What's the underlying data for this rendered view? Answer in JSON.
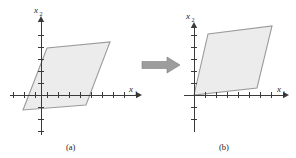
{
  "figure": {
    "type": "geometry-diagram",
    "background_color": "#ffffff",
    "region_fill_color": "#ececec",
    "region_stroke_color": "#9a9a9a",
    "axis_color": "#3a3a3a",
    "arrow_color": "#9d9d9d"
  },
  "panels": [
    {
      "id": "panel-a",
      "caption": "(a)",
      "caption_x": 72,
      "caption_y": 148,
      "origin": {
        "x": 41,
        "y": 95
      },
      "x_axis": {
        "label_main": "x",
        "label_sub": "1",
        "label_x": 129,
        "label_y": 92,
        "start_x": 10,
        "end_x": 136,
        "tick_spacing": 11,
        "tick_half_length": 3,
        "tick_positions": [
          -28,
          -17,
          -6,
          6,
          17,
          28,
          39,
          50,
          61,
          72,
          83
        ],
        "arrow_tip_x": 140
      },
      "y_axis": {
        "label_main": "x",
        "label_sub": "2",
        "label_x": 36,
        "label_y": 11,
        "start_y": 135,
        "end_y": 22,
        "tick_spacing": 12,
        "tick_half_length": 3,
        "tick_positions": [
          -36,
          -24,
          -12,
          12,
          24,
          36,
          48,
          60
        ],
        "arrow_tip_y": 18
      },
      "region": {
        "name": "parallelogram-a",
        "vertices": [
          {
            "x": 23,
            "y": 110
          },
          {
            "x": 47,
            "y": 48
          },
          {
            "x": 110,
            "y": 42
          },
          {
            "x": 86,
            "y": 105
          }
        ]
      }
    },
    {
      "id": "panel-b",
      "caption": "(b)",
      "caption_x": 225,
      "caption_y": 148,
      "origin": {
        "x": 194,
        "y": 95
      },
      "x_axis": {
        "label_main": "x",
        "label_sub": "1",
        "label_x": 282,
        "label_y": 92,
        "start_x": 184,
        "end_x": 284,
        "tick_spacing": 11,
        "tick_half_length": 3,
        "tick_positions": [
          11,
          22,
          33,
          44,
          55,
          66,
          77,
          85
        ],
        "arrow_tip_x": 288
      },
      "y_axis": {
        "label_main": "x",
        "label_sub": "2",
        "label_x": 187,
        "label_y": 18,
        "start_y": 132,
        "end_y": 28,
        "tick_spacing": 12,
        "tick_half_length": 3,
        "tick_positions": [
          -24,
          -12,
          12,
          24,
          36,
          48,
          60
        ],
        "arrow_tip_y": 24
      },
      "region": {
        "name": "parallelogram-b",
        "vertices": [
          {
            "x": 194,
            "y": 95
          },
          {
            "x": 208,
            "y": 34
          },
          {
            "x": 272,
            "y": 26
          },
          {
            "x": 257,
            "y": 88
          }
        ]
      }
    }
  ],
  "transform_arrow": {
    "name": "transformation-arrow",
    "direction": "right",
    "x": 142,
    "y": 58,
    "width": 38,
    "height": 14
  }
}
